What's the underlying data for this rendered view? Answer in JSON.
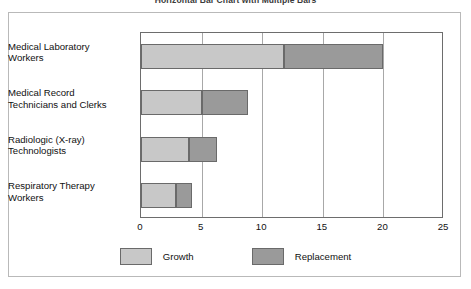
{
  "chart_data": {
    "type": "bar",
    "orientation": "horizontal",
    "stacked": true,
    "title": "Horizontal Bar Chart with Multiple Bars",
    "xlabel": "",
    "ylabel": "",
    "xlim": [
      0,
      25
    ],
    "xticks": [
      0,
      5,
      10,
      15,
      20,
      25
    ],
    "xtick_labels": [
      "0",
      "5",
      "10",
      "15",
      "20",
      "25"
    ],
    "grid": true,
    "grid_axis": "x",
    "legend_position": "bottom-center",
    "categories": [
      "Medical Laboratory Workers",
      "Medical Record Technicians and Clerks",
      "Radiologic (X-ray) Technologists",
      "Respiratory Therapy Workers"
    ],
    "category_lines": [
      [
        "Medical Laboratory",
        "Workers"
      ],
      [
        "Medical Record",
        "Technicians and Clerks"
      ],
      [
        "Radiologic (X-ray)",
        "Technologists"
      ],
      [
        "Respiratory Therapy",
        "Workers"
      ]
    ],
    "series": [
      {
        "name": "Growth",
        "color": "#c8c8c8",
        "values": [
          11.8,
          5.0,
          4.0,
          2.9
        ]
      },
      {
        "name": "Replacement",
        "color": "#9a9a9a",
        "values": [
          8.2,
          3.8,
          2.3,
          1.3
        ]
      }
    ],
    "totals": [
      20.0,
      8.8,
      6.3,
      4.2
    ]
  },
  "legend": {
    "items": [
      {
        "label": "Growth",
        "color": "#c8c8c8"
      },
      {
        "label": "Replacement",
        "color": "#9a9a9a"
      }
    ]
  },
  "colors": {
    "growth": "#c8c8c8",
    "replacement": "#9a9a9a",
    "plot_border": "#6d6d6d",
    "gridline": "#a8a8a8",
    "outer_frame": "#b9b9b9",
    "text": "#111111"
  }
}
